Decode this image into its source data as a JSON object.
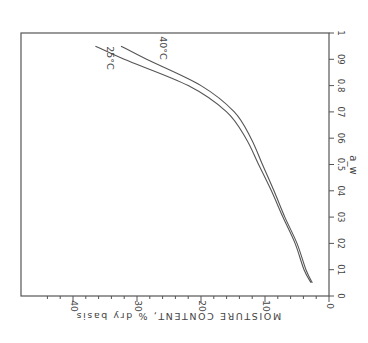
{
  "chart_data": {
    "type": "line",
    "orientation": "rotated 90° clockwise (printed sideways)",
    "title": "",
    "xlabel": "a_w",
    "ylabel": "MOISTURE CONTENT, % dry basis",
    "xlim": [
      0,
      1
    ],
    "ylim": [
      0,
      48
    ],
    "x_ticks": [
      "0",
      "0.1",
      "0.2",
      "0.3",
      "0.4",
      "0.5",
      "0.6",
      "0.7",
      "0.8",
      "0.9",
      "1"
    ],
    "x_tick_labels_displayed": [
      "0",
      "01",
      "02",
      "03",
      "04",
      "0.5",
      "06",
      "07",
      "0.8",
      "09",
      "1"
    ],
    "y_ticks": [
      "0",
      "10",
      "20",
      "30",
      "40"
    ],
    "grid": false,
    "legend": "inline curve labels",
    "series": [
      {
        "name": "25°C",
        "x": [
          0.05,
          0.1,
          0.2,
          0.3,
          0.4,
          0.5,
          0.6,
          0.7,
          0.8,
          0.9,
          0.95
        ],
        "values": [
          2.8,
          3.9,
          5.3,
          7.2,
          9.0,
          11.0,
          13.0,
          16.0,
          22.0,
          32.0,
          36.5
        ]
      },
      {
        "name": "40°C",
        "x": [
          0.05,
          0.1,
          0.2,
          0.3,
          0.4,
          0.5,
          0.6,
          0.7,
          0.8,
          0.9,
          0.95
        ],
        "values": [
          2.6,
          3.6,
          5.0,
          6.9,
          8.6,
          10.4,
          12.2,
          14.8,
          20.0,
          28.5,
          32.5
        ]
      }
    ],
    "annotations": [
      "25°C",
      "40°C"
    ]
  }
}
